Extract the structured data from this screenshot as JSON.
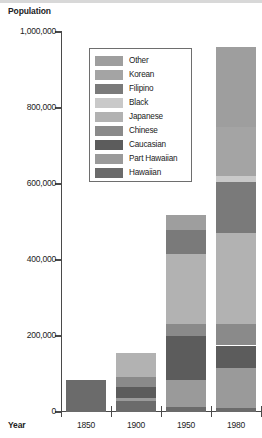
{
  "chart_data": {
    "type": "bar",
    "subtype": "stacked",
    "title": "",
    "ylabel": "Population",
    "xlabel": "Year",
    "categories": [
      "1850",
      "1900",
      "1950",
      "1980"
    ],
    "ylim": [
      0,
      1000000
    ],
    "ytick_values": [
      0,
      200000,
      400000,
      600000,
      800000,
      1000000
    ],
    "ytick_labels": [
      "0",
      "200,000",
      "400,000",
      "600,000",
      "800,000",
      "1,000,000"
    ],
    "grid": false,
    "legend_position": "upper-center",
    "series": [
      {
        "name": "Hawaiian",
        "color": "#6b6b6b",
        "values": [
          84000,
          30000,
          12000,
          10000
        ]
      },
      {
        "name": "Part Hawaiian",
        "color": "#9a9a9a",
        "values": [
          0,
          8000,
          73000,
          105000
        ]
      },
      {
        "name": "Caucasian",
        "color": "#5c5c5c",
        "values": [
          0,
          27000,
          115000,
          60000
        ]
      },
      {
        "name": "Chinese",
        "color": "#8a8a8a",
        "values": [
          0,
          26000,
          32000,
          56000
        ]
      },
      {
        "name": "Japanese",
        "color": "#b2b2b2",
        "values": [
          0,
          63000,
          185000,
          240000
        ]
      },
      {
        "name": "Black",
        "color": "#c9c9c9",
        "values": [
          0,
          0,
          0,
          17000
        ]
      },
      {
        "name": "Filipino",
        "color": "#7a7a7a",
        "values": [
          0,
          0,
          61000,
          133000
        ]
      },
      {
        "name": "Korean",
        "color": "#a4a4a4",
        "values": [
          0,
          0,
          0,
          130000
        ]
      },
      {
        "name": "Other",
        "color": "#9e9e9e",
        "values": [
          0,
          0,
          40000,
          210000
        ]
      }
    ],
    "totals": [
      84000,
      154000,
      518000,
      965000
    ],
    "legend_order": [
      "Other",
      "Korean",
      "Filipino",
      "Black",
      "Japanese",
      "Chinese",
      "Caucasian",
      "Part Hawaiian",
      "Hawaiian"
    ],
    "stack_order": [
      "Hawaiian",
      "Part Hawaiian",
      "Caucasian",
      "Chinese",
      "Japanese",
      "Filipino",
      "Black",
      "Korean",
      "Other"
    ]
  },
  "legend": {
    "items": [
      {
        "label": "Other",
        "color": "#9e9e9e"
      },
      {
        "label": "Korean",
        "color": "#a4a4a4"
      },
      {
        "label": "Filipino",
        "color": "#7a7a7a"
      },
      {
        "label": "Black",
        "color": "#c9c9c9"
      },
      {
        "label": "Japanese",
        "color": "#b2b2b2"
      },
      {
        "label": "Chinese",
        "color": "#8a8a8a"
      },
      {
        "label": "Caucasian",
        "color": "#5c5c5c"
      },
      {
        "label": "Part Hawaiian",
        "color": "#9a9a9a"
      },
      {
        "label": "Hawaiian",
        "color": "#6b6b6b"
      }
    ]
  },
  "axes": {
    "y_title": "Population",
    "x_title": "Year"
  },
  "colors": {
    "axis": "#4a4a4a",
    "legend_border": "#6e6e6e",
    "background": "#ffffff"
  }
}
